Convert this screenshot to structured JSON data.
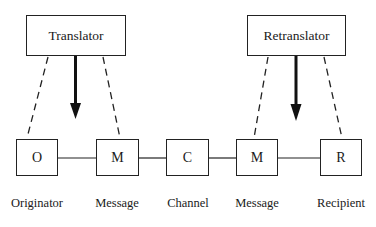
{
  "diagram": {
    "top_boxes": [
      {
        "id": "translator",
        "label": "Translator"
      },
      {
        "id": "retranslator",
        "label": "Retranslator"
      }
    ],
    "nodes": [
      {
        "id": "O",
        "symbol": "O",
        "label": "Originator"
      },
      {
        "id": "M1",
        "symbol": "M",
        "label": "Message"
      },
      {
        "id": "C",
        "symbol": "C",
        "label": "Channel"
      },
      {
        "id": "M2",
        "symbol": "M",
        "label": "Message"
      },
      {
        "id": "R",
        "symbol": "R",
        "label": "Recipient"
      }
    ],
    "edges": [
      {
        "from": "O",
        "to": "M1",
        "style": "solid"
      },
      {
        "from": "M1",
        "to": "C",
        "style": "solid"
      },
      {
        "from": "C",
        "to": "M2",
        "style": "solid"
      },
      {
        "from": "M2",
        "to": "R",
        "style": "solid"
      },
      {
        "from": "translator",
        "to": "O",
        "style": "dashed"
      },
      {
        "from": "translator",
        "to": "M1",
        "style": "dashed"
      },
      {
        "from": "translator",
        "to": "between O and M1",
        "style": "arrow"
      },
      {
        "from": "retranslator",
        "to": "M2",
        "style": "dashed"
      },
      {
        "from": "retranslator",
        "to": "R",
        "style": "dashed"
      },
      {
        "from": "retranslator",
        "to": "between M2 and R",
        "style": "arrow"
      }
    ]
  }
}
